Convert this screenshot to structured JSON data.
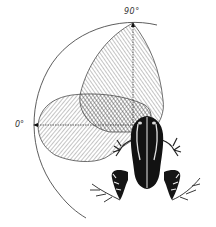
{
  "figure": {
    "labels": {
      "angle_90": "90°",
      "angle_0": "0°"
    },
    "colors": {
      "ink": "#222222",
      "hatch": "#555555",
      "frog_dark": "#111111",
      "frog_light": "#f2f2f2",
      "background": "#ffffff"
    },
    "elements": {
      "outer_arc": "reference-arc",
      "axis_90": "vertical-axis-to-90-degrees",
      "axis_0": "horizontal-axis-to-0-degrees",
      "lobe_upper": "upper-hatched-lobe",
      "lobe_left": "left-hatched-lobe",
      "overlap": "cross-hatched-overlap-region",
      "animal": "frog-dorsal-view"
    }
  }
}
